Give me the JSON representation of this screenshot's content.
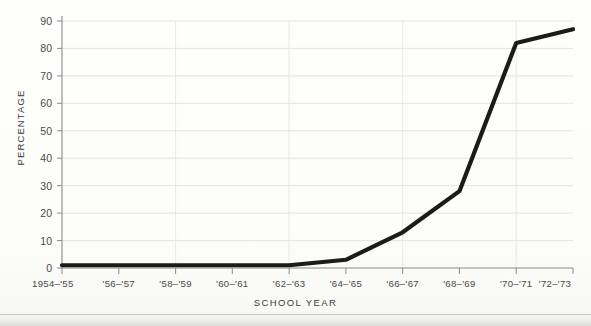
{
  "chart_data": {
    "type": "line",
    "title": "",
    "subtitle": "",
    "xlabel": "SCHOOL  YEAR",
    "ylabel": "PERCENTAGE",
    "categories": [
      "1954–'55",
      "'56–'57",
      "'58–'59",
      "'60–'61",
      "'62–'63",
      "'64–'65",
      "'66–'67",
      "'68–'69",
      "'70–'71",
      "'72–'73"
    ],
    "values": [
      1,
      1,
      1,
      1,
      1,
      3,
      13,
      28,
      82,
      87
    ],
    "series": [
      {
        "name": "Percentage",
        "values": [
          1,
          1,
          1,
          1,
          1,
          3,
          13,
          28,
          82,
          87
        ]
      }
    ],
    "ylim": [
      0,
      90
    ],
    "xlim": [
      0,
      9
    ],
    "yticks": [
      0,
      10,
      20,
      30,
      40,
      50,
      60,
      70,
      80,
      90
    ],
    "ytick_labels": [
      "0",
      "10",
      "20",
      "30",
      "40",
      "50",
      "60",
      "70",
      "80",
      "90"
    ],
    "xtick_labels": [
      "1954–'55",
      "'56–'57",
      "'58–'59",
      "'60–'61",
      "'62–'63",
      "'64–'65",
      "'66–'67",
      "'68–'69",
      "'70–'71",
      "'72–'73"
    ],
    "grid": "horizontal-and-vertical",
    "legend": "none",
    "line_color": "#1b1b1b",
    "grid_color": "#dcdcdc",
    "axis_color": "#8a8a8a",
    "background_color": "#fdfdfb"
  }
}
